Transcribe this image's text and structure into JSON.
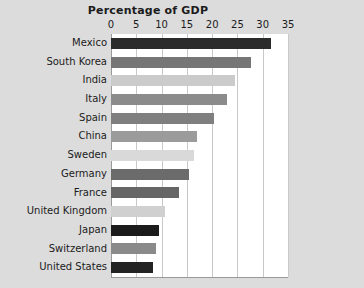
{
  "chart_data": {
    "type": "bar",
    "orientation": "horizontal",
    "title": "Percentage of GDP",
    "xlabel": "",
    "ylabel": "",
    "xlim": [
      0,
      35
    ],
    "xticks": [
      0,
      5,
      10,
      15,
      20,
      25,
      30,
      35
    ],
    "xtick_labels": [
      "0",
      "5",
      "10",
      "15",
      "20",
      "25",
      "30",
      "35"
    ],
    "grid": "vertical",
    "legend": "none",
    "background_color": "#dcdcdc",
    "plot_background_color": "#ffffff",
    "gridline_color": "#c9c9c9",
    "axis_color": "#9a9a9a",
    "text_color": "#1b1b1b",
    "categories": [
      "Mexico",
      "South Korea",
      "India",
      "Italy",
      "Spain",
      "China",
      "Sweden",
      "Germany",
      "France",
      "United Kingdom",
      "Japan",
      "Switzerland",
      "United States"
    ],
    "values": [
      31.6,
      27.6,
      24.6,
      22.9,
      20.4,
      17.1,
      16.5,
      15.4,
      13.4,
      10.7,
      9.4,
      8.8,
      8.4
    ],
    "bar_colors": [
      "#2b2b2b",
      "#767676",
      "#cbcbcb",
      "#8b8b8b",
      "#7f7f7f",
      "#9b9b9b",
      "#d9d9d9",
      "#6b6b6b",
      "#666666",
      "#d0d0d0",
      "#1b1b1b",
      "#8a8a8a",
      "#232323"
    ]
  }
}
